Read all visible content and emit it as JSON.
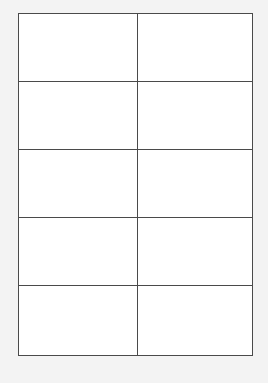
{
  "document": {
    "type": "label-sheet",
    "columns": 2,
    "rows": 5,
    "colors": {
      "background": "#f3f3f3",
      "cell": "#ffffff",
      "border": "#4a4a4a"
    },
    "cells": [
      {
        "row": 1,
        "col": 1,
        "text": ""
      },
      {
        "row": 1,
        "col": 2,
        "text": ""
      },
      {
        "row": 2,
        "col": 1,
        "text": ""
      },
      {
        "row": 2,
        "col": 2,
        "text": ""
      },
      {
        "row": 3,
        "col": 1,
        "text": ""
      },
      {
        "row": 3,
        "col": 2,
        "text": ""
      },
      {
        "row": 4,
        "col": 1,
        "text": ""
      },
      {
        "row": 4,
        "col": 2,
        "text": ""
      },
      {
        "row": 5,
        "col": 1,
        "text": ""
      },
      {
        "row": 5,
        "col": 2,
        "text": ""
      }
    ]
  }
}
